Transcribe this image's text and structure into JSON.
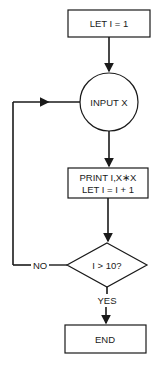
{
  "flowchart": {
    "start_box": {
      "label": "LET I = 1"
    },
    "input_node": {
      "label": "INPUT X"
    },
    "process_box": {
      "line1": "PRINT I,X∗X",
      "line2": "LET I = I + 1"
    },
    "decision": {
      "label": "I > 10?",
      "no_label": "NO",
      "yes_label": "YES"
    },
    "end_box": {
      "label": "END"
    }
  },
  "colors": {
    "stroke": "#1a1a1a",
    "background": "#ffffff"
  }
}
